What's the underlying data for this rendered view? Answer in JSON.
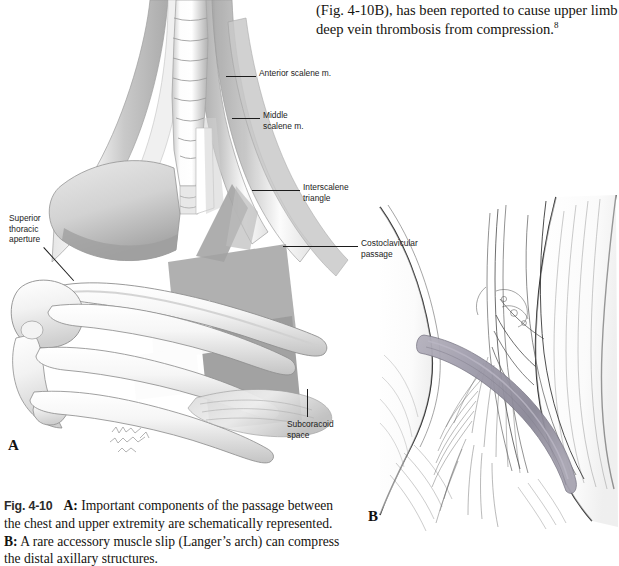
{
  "page": {
    "width": 619,
    "height": 566,
    "background": "#ffffff"
  },
  "body_text": {
    "line1": "(Fig. 4-10B), has been reported to cause upper limb",
    "line2_pre": "deep vein thrombosis from compression.",
    "line2_sup": "8"
  },
  "caption": {
    "figure_number": "Fig. 4-10",
    "part_a_label": "A:",
    "part_a_text": " Important components of the passage between the chest and upper extremity are schematically represented. ",
    "part_b_label": "B:",
    "part_b_text": " A rare accessory muscle slip (Langer’s arch) can compress the distal axillary structures."
  },
  "panels": {
    "a_letter": "A",
    "b_letter": "B"
  },
  "labels": {
    "anterior_scalene": "Anterior scalene m.",
    "middle_scalene": "Middle\nscalene m.",
    "interscalene_triangle": "Interscalene\ntriangle",
    "costoclavicular_passage": "Costoclavicular\npassage",
    "subcoracoid_space": "Subcoracoid\nspace",
    "superior_thoracic_aperture": "Superior\nthoracic\naperture"
  },
  "colors": {
    "ink": "#15130f",
    "label_ink": "#1c1c1c",
    "leader_line": "#1c1c1c",
    "fig_number": "#2b2b2b",
    "shade_dark": "#9a9a9a",
    "shade_mid": "#b6b6b6",
    "shade_light": "#d6d6d6",
    "shade_pale": "#eaeaea",
    "bone_light": "#f4f4f4",
    "bone_outline": "#8d8d8d",
    "langer_arch": "#9b98a6",
    "line_art": "#2a2a2a"
  },
  "figure_a": {
    "description": "Schematic drawing of cervical spine, scalene muscles, first ribs, clavicle and scapula with shaded polygons marking the thoracic outlet passages",
    "structures": [
      "cervical vertebrae",
      "anterior scalene muscle",
      "middle scalene muscle",
      "first rib",
      "clavicle",
      "scapula",
      "ribs",
      "pectoralis minor",
      "superior thoracic aperture",
      "interscalene triangle",
      "costoclavicular passage",
      "subcoracoid space"
    ],
    "artist_signature": "illegible handwritten artist signature"
  },
  "figure_b": {
    "description": "Pen and ink drawing of the axilla showing an accessory muscle slip (Langer’s arch) crossing over the axillary vessels and brachial plexus",
    "structures": [
      "pectoralis major",
      "latissimus dorsi",
      "axillary artery",
      "axillary vein",
      "brachial plexus cords",
      "Langer’s arch accessory muscle slip"
    ]
  }
}
